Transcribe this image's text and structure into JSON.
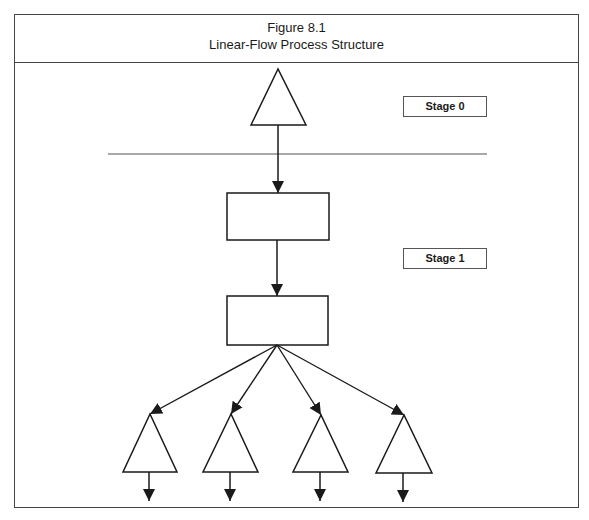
{
  "figure": {
    "number": "Figure 8.1",
    "title": "Linear-Flow Process Structure"
  },
  "stages": [
    {
      "label": "Stage 0"
    },
    {
      "label": "Stage 1"
    }
  ],
  "colors": {
    "stroke": "#1a1a1a",
    "frame": "#444444",
    "background": "#ffffff"
  },
  "diagram": {
    "nodes": [
      {
        "id": "source-triangle",
        "shape": "triangle",
        "stage": 0
      },
      {
        "id": "process-box-1",
        "shape": "rectangle",
        "stage": 1
      },
      {
        "id": "process-box-2",
        "shape": "rectangle",
        "stage": 1
      },
      {
        "id": "output-triangle-1",
        "shape": "triangle"
      },
      {
        "id": "output-triangle-2",
        "shape": "triangle"
      },
      {
        "id": "output-triangle-3",
        "shape": "triangle"
      },
      {
        "id": "output-triangle-4",
        "shape": "triangle"
      }
    ],
    "edges": [
      {
        "from": "source-triangle",
        "to": "process-box-1"
      },
      {
        "from": "process-box-1",
        "to": "process-box-2"
      },
      {
        "from": "process-box-2",
        "to": "output-triangle-1"
      },
      {
        "from": "process-box-2",
        "to": "output-triangle-2"
      },
      {
        "from": "process-box-2",
        "to": "output-triangle-3"
      },
      {
        "from": "process-box-2",
        "to": "output-triangle-4"
      },
      {
        "from": "output-triangle-1",
        "to": "out"
      },
      {
        "from": "output-triangle-2",
        "to": "out"
      },
      {
        "from": "output-triangle-3",
        "to": "out"
      },
      {
        "from": "output-triangle-4",
        "to": "out"
      }
    ]
  }
}
